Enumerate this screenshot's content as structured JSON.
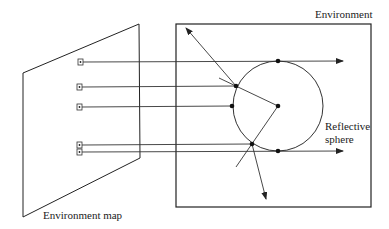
{
  "labels": {
    "environment": "Environment",
    "environment_map": "Environment map",
    "reflective_line1": "Reflective",
    "reflective_line2": "sphere"
  },
  "colors": {
    "stroke": "#222222",
    "background": "#ffffff"
  },
  "geometry": {
    "env_map_plane": [
      [
        23,
        73
      ],
      [
        139,
        24
      ],
      [
        140,
        158
      ],
      [
        23,
        217
      ]
    ],
    "environment_box": {
      "x": 176,
      "y": 24,
      "w": 195,
      "h": 183
    },
    "sphere": {
      "cx": 278,
      "cy": 106,
      "r": 45
    },
    "map_texels_y": [
      62,
      87,
      107,
      145,
      152
    ]
  }
}
